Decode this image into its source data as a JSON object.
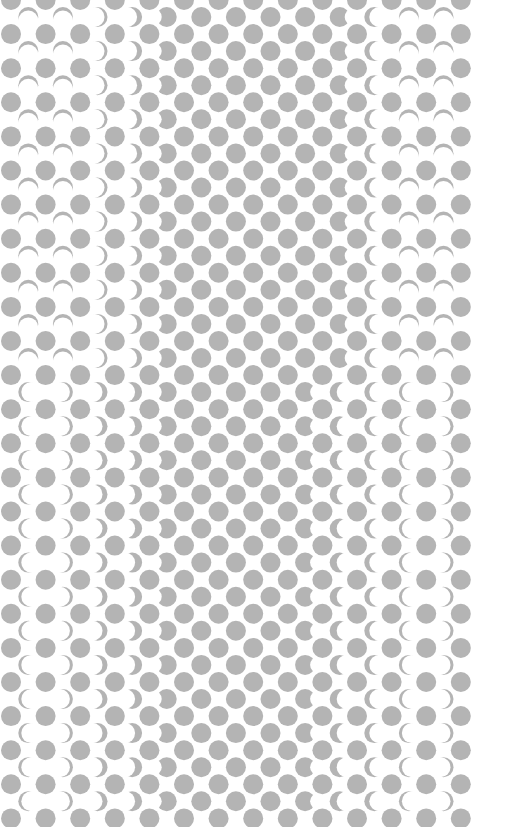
{
  "colors": {
    "background": "#ffffff",
    "dot": "#b4b4b4"
  },
  "pattern": {
    "full_dot_rows": 25,
    "full_dot_columns": 14,
    "offset_dot_rows": 24,
    "offset_dot_columns": 13,
    "offset_columns_shape_top_half": [
      "arc-top",
      "arc-top",
      "crescent-right-thin",
      "crescent-right-medium",
      "bite-right",
      "full",
      "full",
      "full",
      "full",
      "bite-left",
      "crescent-left-medium",
      "arc-top",
      "arc-top"
    ],
    "offset_columns_shape_bottom_half": [
      "crescent-left-thin",
      "crescent-right-thin",
      "crescent-right-medium",
      "crescent-right-thick",
      "bite-right",
      "full",
      "full",
      "full",
      "bite-left",
      "crescent-left-thick",
      "crescent-left-medium",
      "crescent-left-thin",
      "crescent-right-thin"
    ]
  }
}
